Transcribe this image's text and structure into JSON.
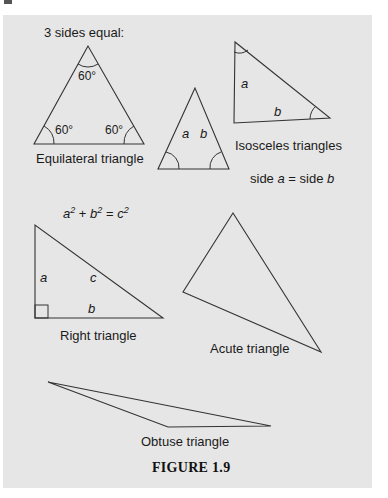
{
  "figure": {
    "caption": "FIGURE 1.9",
    "equilateral": {
      "heading": "3 sides equal:",
      "name": "Equilateral triangle",
      "angles": [
        "60°",
        "60°",
        "60°"
      ]
    },
    "isosceles": {
      "name": "Isosceles triangles",
      "rule_prefix": "side ",
      "rule_a": "a",
      "rule_mid": " = side ",
      "rule_b": "b",
      "small_side_a": "a",
      "small_side_b": "b",
      "large_side_a": "a",
      "large_side_b": "b"
    },
    "right": {
      "formula_a": "a",
      "formula_b": "b",
      "formula_c": "c",
      "formula_exp": "2",
      "formula_plus": " + ",
      "formula_eq": " = ",
      "name": "Right triangle",
      "side_a": "a",
      "side_b": "b",
      "side_c": "c"
    },
    "acute": {
      "name": "Acute triangle"
    },
    "obtuse": {
      "name": "Obtuse triangle"
    }
  }
}
